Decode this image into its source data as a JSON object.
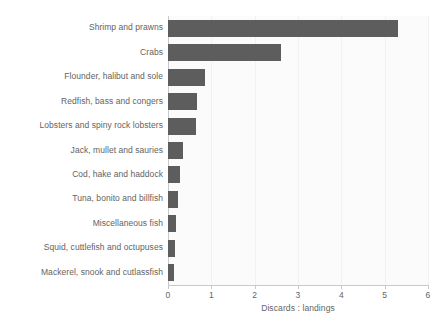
{
  "chart_data": {
    "type": "bar",
    "orientation": "horizontal",
    "title": "",
    "subtitle": "",
    "xlabel": "Discards : landings",
    "ylabel": "",
    "xlim": [
      0,
      6
    ],
    "ylim": null,
    "grid": true,
    "legend": null,
    "xticks": [
      "0",
      "1",
      "2",
      "3",
      "4",
      "5",
      "6"
    ],
    "xtick_values": [
      0,
      1,
      2,
      3,
      4,
      5,
      6
    ],
    "categories": [
      "Shrimp and prawns",
      "Crabs",
      "Flounder, halibut and sole",
      "Redfish, bass and congers",
      "Lobsters and spiny rock lobsters",
      "Jack, mullet and sauries",
      "Cod, hake and haddock",
      "Tuna, bonito and billfish",
      "Miscellaneous fish",
      "Squid, cuttlefish and octupuses",
      "Mackerel, snook and cutlassfish"
    ],
    "values": [
      5.3,
      2.61,
      0.85,
      0.67,
      0.64,
      0.35,
      0.28,
      0.23,
      0.18,
      0.15,
      0.13
    ],
    "colors": {
      "bar": "#5d5d5d",
      "plot_background": "#fbfbfb",
      "gridline": "#f1f1f1",
      "axis_line": "#c9c9c9",
      "text": "#636363",
      "figure_background": "#ffffff"
    }
  }
}
